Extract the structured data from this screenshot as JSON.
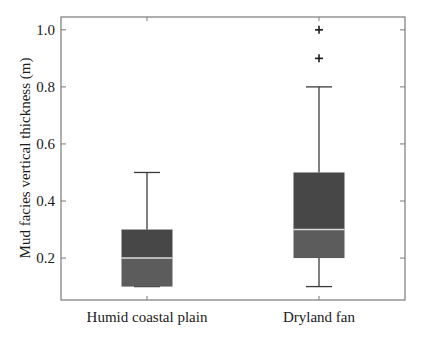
{
  "chart_data": {
    "type": "box",
    "title": "",
    "xlabel": "",
    "ylabel": "Mud facies vertical thickness (m)",
    "ylim": [
      0.053,
      1.045
    ],
    "yticks": [
      0.2,
      0.4,
      0.6,
      0.8,
      1.0
    ],
    "ytick_labels": [
      "0.2",
      "0.4",
      "0.6",
      "0.8",
      "1.0"
    ],
    "grid": false,
    "legend": null,
    "categories": [
      "Humid coastal plain",
      "Dryland fan"
    ],
    "series": [
      {
        "name": "Humid coastal plain",
        "whisker_low": 0.1,
        "q1": 0.1,
        "median": 0.2,
        "q3": 0.3,
        "whisker_high": 0.5,
        "outliers": []
      },
      {
        "name": "Dryland fan",
        "whisker_low": 0.1,
        "q1": 0.2,
        "median": 0.3,
        "q3": 0.5,
        "whisker_high": 0.8,
        "outliers": [
          0.9,
          1.0
        ]
      }
    ],
    "colors": {
      "box_upper": "#474747",
      "box_lower": "#5c5c5c",
      "median": "#d8d8d8",
      "whisker": "#3a3a3a",
      "outlier": "#1a1a1a",
      "axis": "#7a7a7a"
    }
  }
}
